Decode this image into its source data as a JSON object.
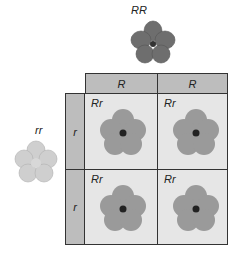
{
  "parents": {
    "top": {
      "genotype": "RR",
      "color": "#7a7a7a"
    },
    "left": {
      "genotype": "rr",
      "color": "#c8c8c8"
    }
  },
  "header": {
    "alleles": [
      "R",
      "R"
    ]
  },
  "side": {
    "alleles": [
      "r",
      "r"
    ]
  },
  "cells": [
    {
      "genotype": "Rr"
    },
    {
      "genotype": "Rr"
    },
    {
      "genotype": "Rr"
    },
    {
      "genotype": "Rr"
    }
  ],
  "colors": {
    "header_fill": "#bdbdbd",
    "cell_fill": "#e6e6e6",
    "offspring_flower": "#9a9a9a",
    "border": "#333333"
  }
}
